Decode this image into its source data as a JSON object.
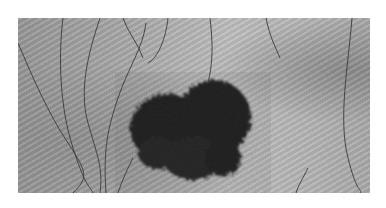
{
  "image": {
    "subject": "skin lesion on hairy skin",
    "description": "Close-up grayscale photograph of a dark irregular pigmented skin lesion surrounded by skin texture and hair strokes",
    "colors": {
      "background": "#ffffff",
      "skin": "#aaaaaa",
      "lesion": "#1a1a1a",
      "hair": "#3a3a3a"
    }
  }
}
